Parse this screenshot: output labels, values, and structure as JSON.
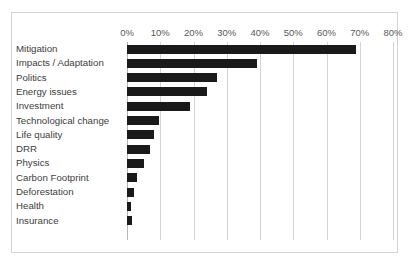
{
  "chart_data": {
    "type": "bar",
    "orientation": "horizontal",
    "title": "",
    "subtitle": "",
    "xlabel": "",
    "ylabel": "",
    "xlim": [
      0,
      80
    ],
    "xtick_labels": [
      "0%",
      "10%",
      "20%",
      "30%",
      "40%",
      "50%",
      "60%",
      "70%",
      "80%"
    ],
    "xtick_values": [
      0,
      10,
      20,
      30,
      40,
      50,
      60,
      70,
      80
    ],
    "grid": true,
    "legend": false,
    "bar_color": "#1a1a1a",
    "gridline_color": "#d4d4d4",
    "frame_color": "#d4d4d4",
    "categories": [
      "Mitigation",
      "Impacts / Adaptation",
      "Politics",
      "Energy issues",
      "Investment",
      "Technological change",
      "Life quality",
      "DRR",
      "Physics",
      "Carbon Footprint",
      "Deforestation",
      "Health",
      "Insurance"
    ],
    "values": [
      69,
      39,
      27,
      24,
      19,
      9.5,
      8,
      7,
      5,
      3,
      2,
      1.3,
      1.5
    ],
    "value_unit": "%"
  }
}
